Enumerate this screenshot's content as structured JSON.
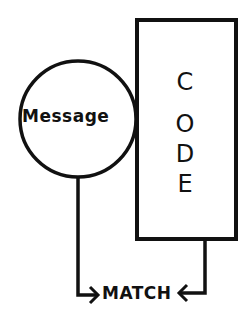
{
  "diagram": {
    "circle_label": "Message",
    "box_letters": [
      "C",
      "O",
      "D",
      "E"
    ],
    "result_label": "MATCH"
  },
  "colors": {
    "stroke": "#111111",
    "background": "#ffffff"
  }
}
